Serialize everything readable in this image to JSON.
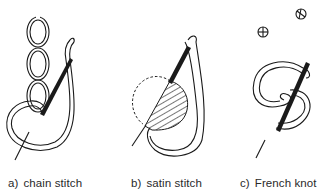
{
  "figure": {
    "panels": [
      {
        "letter": "a)",
        "caption": "chain stitch",
        "icon": "chain-stitch-illustration"
      },
      {
        "letter": "b)",
        "caption": "satin stitch",
        "icon": "satin-stitch-illustration"
      },
      {
        "letter": "c)",
        "caption": "French knot",
        "icon": "french-knot-illustration"
      }
    ]
  },
  "colors": {
    "ink": "#1a1a1a",
    "background": "#ffffff"
  }
}
